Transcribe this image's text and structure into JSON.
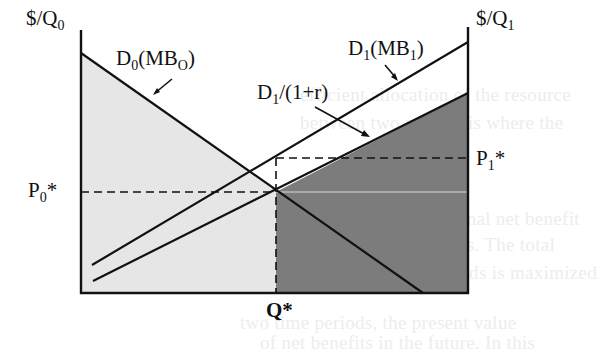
{
  "diagram": {
    "type": "two-period intertemporal allocation (depletable resource)",
    "axes": {
      "left_axis_label": {
        "base": "$/Q",
        "sub": "0"
      },
      "right_axis_label": {
        "base": "$/Q",
        "sub": "1"
      },
      "x_marker_label": "Q*"
    },
    "curves": [
      {
        "id": "D0",
        "label_base": "D",
        "label_sub": "0",
        "label_paren_base": "(MB",
        "label_paren_sub": "O",
        "label_close": ")",
        "direction": "downward-sloping from left axis"
      },
      {
        "id": "D1",
        "label_base": "D",
        "label_sub": "1",
        "label_paren_base": "(MB",
        "label_paren_sub": "1",
        "label_close": ")",
        "direction": "upward-sloping to right axis"
      },
      {
        "id": "D1_discounted",
        "label_base": "D",
        "label_sub": "1",
        "label_rest": "/(1+r)",
        "direction": "upward-sloping to right axis, below D1"
      }
    ],
    "price_labels": {
      "p0": {
        "base": "P",
        "sub": "0",
        "star": "*"
      },
      "p1": {
        "base": "P",
        "sub": "1",
        "star": "*"
      }
    },
    "regions": [
      {
        "name": "period-0 net benefit area",
        "shade": "light-gray",
        "color": "#e6e6e6"
      },
      {
        "name": "period-1 discounted net benefit area",
        "shade": "dark-gray",
        "color": "#7a7a7a"
      }
    ],
    "colors": {
      "line": "#111111",
      "light_fill": "#e6e6e6",
      "dark_fill": "#7c7c7c",
      "background": "#ffffff"
    }
  },
  "background_text": {
    "lines": [
      "efficient allocation of the resource",
      "between two periods is where the",
      "present value of marginal net benefit",
      "is equal in both periods. The total",
      "welfare over two periods is maximized",
      "two time periods, the present value",
      "of net benefits in the future. In this"
    ]
  }
}
